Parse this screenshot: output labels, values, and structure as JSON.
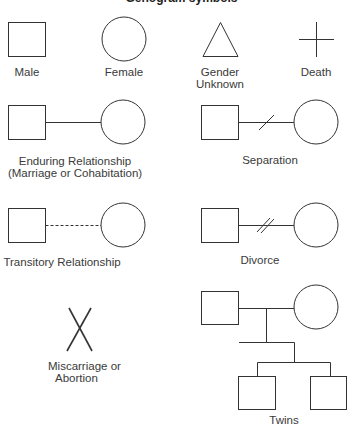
{
  "title": "Genogram symbols",
  "symbols": {
    "male": {
      "label": "Male"
    },
    "female": {
      "label": "Female"
    },
    "gender_unknown": {
      "label_line1": "Gender",
      "label_line2": "Unknown"
    },
    "death": {
      "label": "Death"
    },
    "enduring": {
      "label_line1": "Enduring Relationship",
      "label_line2": "(Marriage or Cohabitation)"
    },
    "separation": {
      "label": "Separation"
    },
    "transitory": {
      "label": "Transitory Relationship"
    },
    "divorce": {
      "label": "Divorce"
    },
    "miscarriage": {
      "label_line1": "Miscarriage or",
      "label_line2": "Abortion"
    },
    "twins": {
      "label": "Twins"
    }
  },
  "colors": {
    "stroke": "#333333",
    "text": "#3a3a3a",
    "background": "#ffffff"
  }
}
